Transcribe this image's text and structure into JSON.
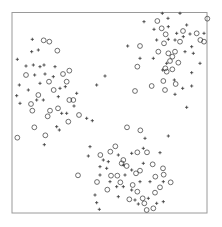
{
  "chart_data": {
    "type": "scatter",
    "title": "",
    "xlabel": "",
    "ylabel": "",
    "xlim": [
      0,
      1
    ],
    "ylim": [
      0,
      1
    ],
    "grid": false,
    "axes_ticks": false,
    "legend": null,
    "frame_color": "#9a9a9a",
    "marker_color": "#333333",
    "series": [
      {
        "name": "circles",
        "marker": "o",
        "points_px3": [
          [
            472,
            63
          ],
          [
            485,
            85
          ],
          [
            622,
            56
          ],
          [
            497,
            103
          ],
          [
            549,
            93
          ],
          [
            590,
            100
          ],
          [
            601,
            120
          ],
          [
            612,
            125
          ],
          [
            420,
            138
          ],
          [
            475,
            155
          ],
          [
            492,
            130
          ],
          [
            505,
            160
          ],
          [
            517,
            170
          ],
          [
            525,
            155
          ],
          [
            540,
            125
          ],
          [
            510,
            183
          ],
          [
            496,
            205
          ],
          [
            500,
            215
          ],
          [
            517,
            208
          ],
          [
            535,
            188
          ],
          [
            412,
            200
          ],
          [
            490,
            243
          ],
          [
            527,
            252
          ],
          [
            495,
            270
          ],
          [
            455,
            258
          ],
          [
            405,
            273
          ],
          [
            131,
            121
          ],
          [
            148,
            125
          ],
          [
            172,
            152
          ],
          [
            78,
            225
          ],
          [
            189,
            222
          ],
          [
            208,
            212
          ],
          [
            147,
            245
          ],
          [
            161,
            270
          ],
          [
            200,
            245
          ],
          [
            115,
            285
          ],
          [
            208,
            300
          ],
          [
            220,
            300
          ],
          [
            93,
            312
          ],
          [
            97,
            332
          ],
          [
            150,
            332
          ],
          [
            143,
            349
          ],
          [
            174,
            325
          ],
          [
            205,
            365
          ],
          [
            237,
            345
          ],
          [
            103,
            382
          ],
          [
            136,
            406
          ],
          [
            52,
            413
          ],
          [
            381,
            382
          ],
          [
            421,
            391
          ],
          [
            346,
            439
          ],
          [
            331,
            455
          ],
          [
            301,
            465
          ],
          [
            412,
            457
          ],
          [
            441,
            457
          ],
          [
            370,
            480
          ],
          [
            458,
            493
          ],
          [
            489,
            505
          ],
          [
            491,
            524
          ],
          [
            234,
            526
          ],
          [
            291,
            546
          ],
          [
            333,
            527
          ],
          [
            352,
            527
          ],
          [
            361,
            547
          ],
          [
            365,
            490
          ],
          [
            380,
            498
          ],
          [
            408,
            520
          ],
          [
            420,
            512
          ],
          [
            466,
            530
          ],
          [
            512,
            547
          ],
          [
            322,
            569
          ],
          [
            398,
            555
          ],
          [
            412,
            575
          ],
          [
            480,
            562
          ],
          [
            465,
            578
          ],
          [
            388,
            598
          ],
          [
            428,
            595
          ],
          [
            440,
            630
          ],
          [
            460,
            625
          ],
          [
            433,
            610
          ]
        ]
      },
      {
        "name": "plus",
        "marker": "+",
        "points_px3": [
          [
            487,
            40
          ],
          [
            540,
            40
          ],
          [
            504,
            55
          ],
          [
            432,
            65
          ],
          [
            560,
            75
          ],
          [
            462,
            88
          ],
          [
            530,
            100
          ],
          [
            550,
            110
          ],
          [
            570,
            102
          ],
          [
            383,
            138
          ],
          [
            505,
            118
          ],
          [
            460,
            175
          ],
          [
            420,
            175
          ],
          [
            575,
            140
          ],
          [
            580,
            160
          ],
          [
            555,
            155
          ],
          [
            525,
            120
          ],
          [
            500,
            190
          ],
          [
            488,
            210
          ],
          [
            523,
            240
          ],
          [
            575,
            218
          ],
          [
            548,
            265
          ],
          [
            575,
            258
          ],
          [
            525,
            283
          ],
          [
            600,
            190
          ],
          [
            560,
            322
          ],
          [
            505,
            80
          ],
          [
            470,
            120
          ],
          [
            612,
            100
          ],
          [
            97,
            118
          ],
          [
            95,
            155
          ],
          [
            115,
            150
          ],
          [
            52,
            178
          ],
          [
            78,
            198
          ],
          [
            100,
            195
          ],
          [
            120,
            200
          ],
          [
            132,
            195
          ],
          [
            165,
            200
          ],
          [
            104,
            225
          ],
          [
            135,
            222
          ],
          [
            160,
            230
          ],
          [
            58,
            255
          ],
          [
            85,
            270
          ],
          [
            180,
            265
          ],
          [
            196,
            260
          ],
          [
            230,
            280
          ],
          [
            50,
            287
          ],
          [
            110,
            300
          ],
          [
            130,
            300
          ],
          [
            175,
            290
          ],
          [
            222,
            318
          ],
          [
            60,
            310
          ],
          [
            185,
            340
          ],
          [
            200,
            340
          ],
          [
            260,
            355
          ],
          [
            277,
            362
          ],
          [
            170,
            380
          ],
          [
            178,
            390
          ],
          [
            133,
            434
          ],
          [
            290,
            255
          ],
          [
            315,
            228
          ],
          [
            120,
            250
          ],
          [
            270,
            440
          ],
          [
            435,
            415
          ],
          [
            505,
            408
          ],
          [
            265,
            468
          ],
          [
            310,
            480
          ],
          [
            325,
            485
          ],
          [
            355,
            465
          ],
          [
            395,
            460
          ],
          [
            430,
            445
          ],
          [
            480,
            458
          ],
          [
            300,
            500
          ],
          [
            320,
            505
          ],
          [
            370,
            495
          ],
          [
            430,
            490
          ],
          [
            300,
            525
          ],
          [
            375,
            525
          ],
          [
            395,
            510
          ],
          [
            330,
            545
          ],
          [
            350,
            560
          ],
          [
            395,
            570
          ],
          [
            420,
            545
          ],
          [
            450,
            545
          ],
          [
            490,
            545
          ],
          [
            285,
            585
          ],
          [
            290,
            608
          ],
          [
            298,
            628
          ],
          [
            370,
            560
          ],
          [
            355,
            590
          ],
          [
            405,
            600
          ],
          [
            445,
            595
          ],
          [
            470,
            610
          ],
          [
            490,
            605
          ],
          [
            415,
            612
          ]
        ]
      }
    ],
    "clusters": [
      {
        "name": "upper-right",
        "center_approx": [
          0.8,
          0.8
        ]
      },
      {
        "name": "left",
        "center_approx": [
          0.2,
          0.55
        ]
      },
      {
        "name": "bottom",
        "center_approx": [
          0.6,
          0.15
        ]
      }
    ]
  }
}
